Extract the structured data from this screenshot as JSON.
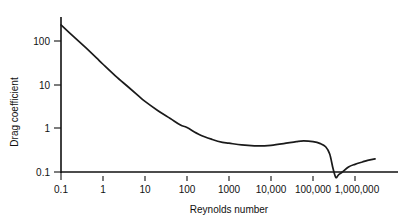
{
  "chart_data": {
    "type": "line",
    "title": "",
    "xlabel": "Reynolds number",
    "ylabel": "Drag coefficient",
    "xscale": "log",
    "yscale": "log",
    "xlim": [
      0.1,
      3000000
    ],
    "ylim": [
      0.1,
      300
    ],
    "grid": false,
    "legend": null,
    "xticks": [
      {
        "value": 0.1,
        "label": "0.1"
      },
      {
        "value": 1,
        "label": "1"
      },
      {
        "value": 10,
        "label": "10"
      },
      {
        "value": 100,
        "label": "100"
      },
      {
        "value": 1000,
        "label": "1000"
      },
      {
        "value": 10000,
        "label": "10,000"
      },
      {
        "value": 100000,
        "label": "100,000"
      },
      {
        "value": 1000000,
        "label": "1,000,000"
      }
    ],
    "yticks": [
      {
        "value": 100,
        "label": "100"
      },
      {
        "value": 10,
        "label": "10"
      },
      {
        "value": 1,
        "label": "1"
      },
      {
        "value": 0.1,
        "label": "0.1"
      }
    ],
    "series": [
      {
        "name": "Drag coefficient of a sphere",
        "x": [
          0.1,
          0.2,
          0.4,
          0.7,
          1,
          2,
          4,
          7,
          10,
          20,
          40,
          70,
          100,
          200,
          400,
          700,
          1000,
          2000,
          4000,
          7000,
          10000,
          20000,
          40000,
          60000,
          100000,
          150000,
          200000,
          250000,
          300000,
          350000,
          400000,
          500000,
          700000,
          1000000,
          1500000,
          2000000,
          3000000
        ],
        "y": [
          240,
          130,
          70,
          42,
          30,
          16,
          9,
          5.6,
          4.2,
          2.6,
          1.7,
          1.2,
          1.05,
          0.72,
          0.56,
          0.48,
          0.46,
          0.42,
          0.4,
          0.4,
          0.41,
          0.45,
          0.5,
          0.52,
          0.5,
          0.45,
          0.38,
          0.26,
          0.12,
          0.075,
          0.085,
          0.1,
          0.13,
          0.15,
          0.17,
          0.185,
          0.2
        ]
      }
    ]
  },
  "axes": {
    "x_title": "Reynolds number",
    "y_title": "Drag coefficient"
  }
}
